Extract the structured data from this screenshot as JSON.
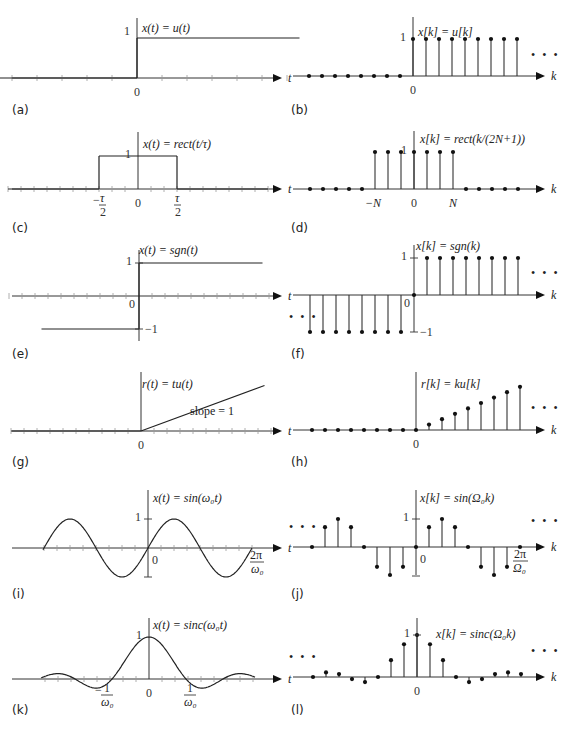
{
  "figure": {
    "colors": {
      "ink": "#222222",
      "axis": "#333333",
      "tick": "#999999",
      "background": "#ffffff"
    },
    "ellipsis": "• • •"
  },
  "chart_data": [
    {
      "id": "a",
      "label": "(a)",
      "type": "line",
      "domain": "continuous",
      "title": "x(t) = u(t)",
      "xlabel": "t",
      "xticks": [
        "0"
      ],
      "yticks": [
        "1"
      ],
      "box": [
        0,
        0,
        288,
        120
      ],
      "axis_y": 78,
      "origin_x": 137,
      "unit": 25,
      "segments": [
        [
          [
            -6,
            0
          ],
          [
            0,
            0
          ]
        ],
        [
          [
            0,
            0
          ],
          [
            0,
            1
          ]
        ],
        [
          [
            0,
            1
          ],
          [
            6.5,
            1
          ]
        ]
      ],
      "xrange": [
        -6,
        7.2
      ],
      "ticks_range": [
        -6,
        6
      ]
    },
    {
      "id": "b",
      "label": "(b)",
      "type": "stem",
      "domain": "discrete",
      "title": "x[k] = u[k]",
      "xlabel": "k",
      "xticks": [
        "0"
      ],
      "yticks": [
        "1"
      ],
      "box": [
        288,
        0,
        289,
        120
      ],
      "axis_y": 76,
      "origin_x": 413,
      "unit": 13,
      "ystem": 37,
      "k": [
        -8,
        -7,
        -6,
        -5,
        -4,
        -3,
        -2,
        -1,
        0,
        1,
        2,
        3,
        4,
        5,
        6,
        7,
        8
      ],
      "values": [
        0,
        0,
        0,
        0,
        0,
        0,
        0,
        0,
        1,
        1,
        1,
        1,
        1,
        1,
        1,
        1,
        1
      ],
      "ellipsis_right": true
    },
    {
      "id": "c",
      "label": "(c)",
      "type": "line",
      "domain": "continuous",
      "title": "x(t) = rect(t/τ)",
      "xlabel": "t",
      "xticks": [
        "−τ/2",
        "0",
        "τ/2"
      ],
      "yticks": [
        "1"
      ],
      "box": [
        0,
        120,
        288,
        120
      ],
      "axis_y": 189,
      "origin_x": 138,
      "unit": 13,
      "segments": [
        [
          [
            -10,
            0
          ],
          [
            -3,
            0
          ]
        ],
        [
          [
            -3,
            0
          ],
          [
            -3,
            1
          ]
        ],
        [
          [
            -3,
            1
          ],
          [
            3,
            1
          ]
        ],
        [
          [
            3,
            1
          ],
          [
            3,
            0
          ]
        ],
        [
          [
            3,
            0
          ],
          [
            10,
            0
          ]
        ]
      ],
      "xrange": [
        -10,
        11
      ],
      "ticks_range": [
        -10,
        10
      ]
    },
    {
      "id": "d",
      "label": "(d)",
      "type": "stem",
      "domain": "discrete",
      "title": "x[k] = rect(k/(2N+1))",
      "xlabel": "k",
      "xticks": [
        "−N",
        "0",
        "N"
      ],
      "yticks": [
        "1"
      ],
      "box": [
        288,
        120,
        289,
        120
      ],
      "axis_y": 189,
      "origin_x": 414,
      "unit": 13,
      "ystem": 37,
      "k": [
        -8,
        -7,
        -6,
        -5,
        -4,
        -3,
        -2,
        -1,
        0,
        1,
        2,
        3,
        4,
        5,
        6,
        7,
        8
      ],
      "values": [
        0,
        0,
        0,
        0,
        0,
        1,
        1,
        1,
        1,
        1,
        1,
        1,
        0,
        0,
        0,
        0,
        0
      ],
      "N": 3
    },
    {
      "id": "e",
      "label": "(e)",
      "type": "line",
      "domain": "continuous",
      "title": "x(t) = sgn(t)",
      "xlabel": "t",
      "xticks": [
        "0"
      ],
      "yticks": [
        "1",
        "−1"
      ],
      "box": [
        0,
        240,
        288,
        130
      ],
      "axis_y": 296,
      "origin_x": 139,
      "unit": 13,
      "yunit": 33,
      "segments": [
        [
          [
            -7.5,
            -1
          ],
          [
            0,
            -1
          ]
        ],
        [
          [
            0,
            -1
          ],
          [
            0,
            1
          ]
        ],
        [
          [
            0,
            1
          ],
          [
            9.5,
            1
          ]
        ]
      ],
      "xrange": [
        -10,
        11
      ],
      "ticks_range": [
        -10,
        10
      ]
    },
    {
      "id": "f",
      "label": "(f)",
      "type": "stem",
      "domain": "discrete",
      "title": "x[k] = sgn(k)",
      "xlabel": "k",
      "xticks": [
        "0"
      ],
      "yticks": [
        "1",
        "−1"
      ],
      "box": [
        288,
        240,
        289,
        130
      ],
      "axis_y": 295,
      "origin_x": 414,
      "unit": 13,
      "ystem": 37,
      "k": [
        -8,
        -7,
        -6,
        -5,
        -4,
        -3,
        -2,
        -1,
        0,
        1,
        2,
        3,
        4,
        5,
        6,
        7,
        8
      ],
      "values": [
        -1,
        -1,
        -1,
        -1,
        -1,
        -1,
        -1,
        -1,
        0,
        1,
        1,
        1,
        1,
        1,
        1,
        1,
        1
      ],
      "ellipsis_left": true,
      "ellipsis_right": true
    },
    {
      "id": "g",
      "label": "(g)",
      "type": "line",
      "domain": "continuous",
      "title": "r(t) = tu(t)",
      "xlabel": "t",
      "xticks": [
        "0"
      ],
      "yticks": [],
      "annotation": "slope = 1",
      "box": [
        0,
        370,
        288,
        120
      ],
      "axis_y": 431,
      "origin_x": 141,
      "unit": 13,
      "yunit": 13,
      "segments": [
        [
          [
            -10,
            0
          ],
          [
            0,
            0
          ]
        ],
        [
          [
            0,
            0
          ],
          [
            9.5,
            3.5
          ]
        ]
      ],
      "xrange": [
        -10,
        11
      ],
      "ticks_range": [
        -10,
        10
      ]
    },
    {
      "id": "h",
      "label": "(h)",
      "type": "stem",
      "domain": "discrete",
      "title": "r[k] = ku[k]",
      "xlabel": "k",
      "xticks": [
        "0"
      ],
      "yticks": [],
      "box": [
        288,
        370,
        289,
        120
      ],
      "axis_y": 430,
      "origin_x": 416,
      "unit": 13,
      "ystem": 5.4,
      "k": [
        -8,
        -7,
        -6,
        -5,
        -4,
        -3,
        -2,
        -1,
        0,
        1,
        2,
        3,
        4,
        5,
        6,
        7,
        8
      ],
      "values": [
        0,
        0,
        0,
        0,
        0,
        0,
        0,
        0,
        0,
        1,
        2,
        3,
        4,
        5,
        6,
        7,
        8
      ],
      "ellipsis_right": true
    },
    {
      "id": "i",
      "label": "(i)",
      "type": "line",
      "domain": "continuous",
      "title": "x(t) = sin(ω₀t)",
      "xlabel": "t",
      "xticks": [
        "0",
        "2π/ω₀"
      ],
      "yticks": [
        "1"
      ],
      "box": [
        0,
        490,
        288,
        120
      ],
      "axis_y": 548,
      "origin_x": 148,
      "unit": 13,
      "yunit": 29,
      "function": "sin",
      "period_px": 104,
      "xstart_px": 43,
      "xend_px": 252,
      "xrange": [
        -10,
        11
      ],
      "ticks_range": [
        -8,
        8
      ]
    },
    {
      "id": "j",
      "label": "(j)",
      "type": "stem",
      "domain": "discrete",
      "title": "x[k] = sin(Ω₀k)",
      "xlabel": "k",
      "xticks": [
        "0",
        "2π/Ω₀"
      ],
      "yticks": [
        "1"
      ],
      "box": [
        288,
        490,
        289,
        120
      ],
      "axis_y": 547,
      "origin_x": 416,
      "unit": 13,
      "ystem": 28,
      "k": [
        -8,
        -7,
        -6,
        -5,
        -4,
        -3,
        -2,
        -1,
        0,
        1,
        2,
        3,
        4,
        5,
        6,
        7,
        8
      ],
      "values": [
        0,
        0.707,
        1,
        0.707,
        0,
        -0.707,
        -1,
        -0.707,
        0,
        0.707,
        1,
        0.707,
        0,
        -0.707,
        -1,
        -0.707,
        0
      ],
      "ellipsis_left": true,
      "ellipsis_right": true
    },
    {
      "id": "k",
      "label": "(k)",
      "type": "line",
      "domain": "continuous",
      "title": "x(t) = sinc(ω₀t)",
      "xlabel": "t",
      "xticks": [
        "−1/ω₀",
        "0",
        "1/ω₀"
      ],
      "yticks": [
        "1"
      ],
      "box": [
        0,
        610,
        288,
        124
      ],
      "axis_y": 679,
      "origin_x": 149,
      "unit": 13,
      "yunit": 42,
      "function": "sinc",
      "zero_px": 37,
      "xstart_px": 41,
      "xend_px": 255,
      "xrange": [
        -10,
        11
      ],
      "ticks_range": [
        -8,
        8
      ]
    },
    {
      "id": "l",
      "label": "(l)",
      "type": "stem",
      "domain": "discrete",
      "title": "x[k] = sinc(Ω₀k)",
      "xlabel": "k",
      "xticks": [
        "0"
      ],
      "yticks": [
        "1"
      ],
      "box": [
        288,
        610,
        289,
        124
      ],
      "axis_y": 677,
      "origin_x": 417,
      "unit": 13,
      "ystem": 42,
      "k": [
        -8,
        -7,
        -6,
        -5,
        -4,
        -3,
        -2,
        -1,
        0,
        1,
        2,
        3,
        4,
        5,
        6,
        7,
        8
      ],
      "values": [
        0,
        0.11,
        0.07,
        -0.05,
        -0.12,
        0,
        0.4,
        0.78,
        1,
        0.78,
        0.4,
        0,
        -0.12,
        -0.05,
        0.07,
        0.11,
        0.07
      ],
      "ellipsis_left": true,
      "ellipsis_right": true
    }
  ]
}
